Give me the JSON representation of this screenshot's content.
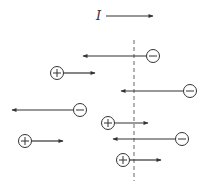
{
  "diagram": {
    "current_label": "I",
    "current_arrow": {
      "x1": 106,
      "x2": 153,
      "y": 16,
      "label_x": 96,
      "label_y": 20
    },
    "boundary": {
      "x": 134,
      "y1": 40,
      "y2": 181,
      "style": "dashed"
    },
    "colors": {
      "stroke": "#333333",
      "boundary": "#666666",
      "background": "#ffffff"
    },
    "charges": [
      {
        "sign": "−",
        "type": "negative",
        "cx": 153,
        "cy": 56,
        "arrow_to": 83,
        "direction": "left"
      },
      {
        "sign": "+",
        "type": "positive",
        "cx": 57,
        "cy": 73,
        "arrow_to": 95,
        "direction": "right"
      },
      {
        "sign": "−",
        "type": "negative",
        "cx": 190,
        "cy": 91,
        "arrow_to": 121,
        "direction": "left"
      },
      {
        "sign": "−",
        "type": "negative",
        "cx": 80,
        "cy": 110,
        "arrow_to": 12,
        "direction": "left"
      },
      {
        "sign": "+",
        "type": "positive",
        "cx": 108,
        "cy": 123,
        "arrow_to": 148,
        "direction": "right"
      },
      {
        "sign": "+",
        "type": "positive",
        "cx": 25,
        "cy": 141,
        "arrow_to": 63,
        "direction": "right"
      },
      {
        "sign": "−",
        "type": "negative",
        "cx": 182,
        "cy": 139,
        "arrow_to": 113,
        "direction": "left"
      },
      {
        "sign": "+",
        "type": "positive",
        "cx": 123,
        "cy": 160,
        "arrow_to": 161,
        "direction": "right"
      }
    ]
  }
}
